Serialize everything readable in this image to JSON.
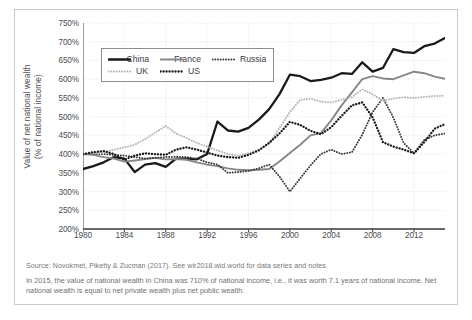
{
  "chart_data": {
    "type": "line",
    "title": "",
    "xlabel": "",
    "ylabel": "Value of net national wealth (% of national income)",
    "ylabel_line1": "Value of net national wealth",
    "ylabel_line2": "(% of national income)",
    "xlim": [
      1980,
      2015
    ],
    "ylim": [
      200,
      750
    ],
    "ytick_step": 50,
    "xtick_step": 4,
    "grid": true,
    "legend_position": "top-left",
    "yticks": [
      "750%",
      "700%",
      "650%",
      "600%",
      "550%",
      "500%",
      "450%",
      "400%",
      "350%",
      "300%",
      "250%",
      "200%"
    ],
    "ytick_values": [
      750,
      700,
      650,
      600,
      550,
      500,
      450,
      400,
      350,
      300,
      250,
      200
    ],
    "xticks": [
      "1980",
      "1984",
      "1988",
      "1992",
      "1996",
      "2000",
      "2004",
      "2008",
      "2012"
    ],
    "xtick_values": [
      1980,
      1984,
      1988,
      1992,
      1996,
      2000,
      2004,
      2008,
      2012
    ],
    "x": [
      1980,
      1981,
      1982,
      1983,
      1984,
      1985,
      1986,
      1987,
      1988,
      1989,
      1990,
      1991,
      1992,
      1993,
      1994,
      1995,
      1996,
      1997,
      1998,
      1999,
      2000,
      2001,
      2002,
      2003,
      2004,
      2005,
      2006,
      2007,
      2008,
      2009,
      2010,
      2011,
      2012,
      2013,
      2014,
      2015
    ],
    "series": [
      {
        "name": "China",
        "color": "#1a1a1a",
        "style": "solid",
        "width": 2.3,
        "values": [
          360,
          368,
          378,
          392,
          388,
          352,
          372,
          376,
          366,
          388,
          388,
          386,
          400,
          487,
          463,
          460,
          470,
          492,
          520,
          560,
          612,
          608,
          595,
          598,
          604,
          616,
          614,
          645,
          620,
          630,
          680,
          672,
          670,
          688,
          695,
          710
        ]
      },
      {
        "name": "France",
        "color": "#878789",
        "style": "solid",
        "width": 1.9,
        "values": [
          400,
          398,
          392,
          388,
          380,
          383,
          387,
          390,
          386,
          387,
          385,
          378,
          372,
          368,
          362,
          358,
          357,
          358,
          360,
          380,
          403,
          425,
          450,
          456,
          490,
          530,
          565,
          600,
          608,
          602,
          600,
          610,
          620,
          616,
          607,
          601
        ]
      },
      {
        "name": "Russia",
        "color": "#3a3a3c",
        "style": "dotted",
        "width": 1.9,
        "values": [
          400,
          400,
          400,
          398,
          396,
          392,
          388,
          390,
          392,
          393,
          392,
          388,
          378,
          372,
          350,
          352,
          355,
          362,
          372,
          340,
          300,
          335,
          370,
          400,
          412,
          400,
          405,
          452,
          512,
          550,
          498,
          430,
          402,
          438,
          450,
          455
        ]
      },
      {
        "name": "UK",
        "color": "#b4b4b6",
        "style": "dotted",
        "width": 1.9,
        "values": [
          400,
          402,
          405,
          412,
          418,
          425,
          440,
          458,
          475,
          455,
          443,
          430,
          420,
          410,
          400,
          396,
          402,
          412,
          428,
          470,
          512,
          545,
          548,
          540,
          538,
          545,
          552,
          573,
          560,
          542,
          548,
          552,
          550,
          553,
          555,
          556
        ]
      },
      {
        "name": "US",
        "color": "#1a1a1a",
        "style": "dotted",
        "width": 2.3,
        "values": [
          400,
          405,
          408,
          400,
          385,
          396,
          402,
          400,
          398,
          412,
          418,
          412,
          404,
          396,
          392,
          390,
          398,
          410,
          430,
          455,
          486,
          478,
          462,
          453,
          472,
          502,
          530,
          538,
          498,
          432,
          420,
          412,
          402,
          432,
          468,
          480
        ]
      }
    ]
  },
  "legend": {
    "items": [
      {
        "label": "China"
      },
      {
        "label": "France"
      },
      {
        "label": "Russia"
      },
      {
        "label": "UK"
      },
      {
        "label": "US"
      }
    ]
  },
  "notes": {
    "source": "Source: Novokmet, Piketty & Zucman (2017). See wir2018.wid.world for data series and notes.",
    "note": "In 2015, the value of national wealth in China was 710% of national income, i.e., it was worth 7.1 years of national income. Net national wealth is equal to net private wealth plus net public wealth."
  }
}
